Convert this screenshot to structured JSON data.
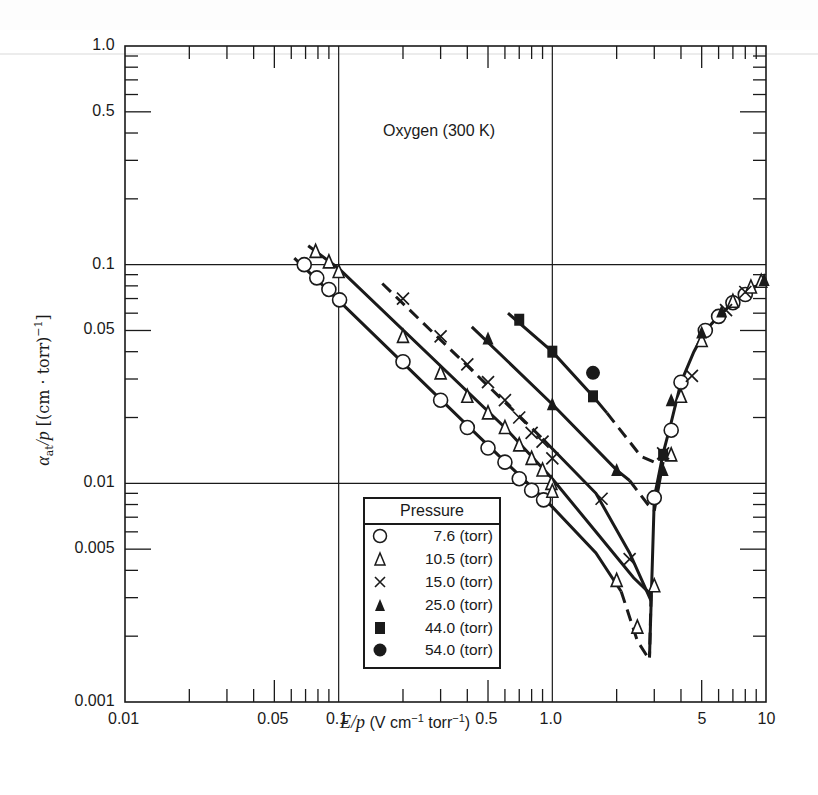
{
  "chart_data": {
    "type": "scatter",
    "title": "Oxygen (300 K)",
    "xlabel": "E/p (V cm^-1 torr^-1)",
    "ylabel": "α_at/p [(cm · torr)^-1]",
    "xscale": "log",
    "yscale": "log",
    "xlim": [
      0.01,
      10
    ],
    "ylim": [
      0.001,
      1.0
    ],
    "x_ticks": [
      "0.01",
      "0.05",
      "0.1",
      "0.5",
      "1.0",
      "5",
      "10"
    ],
    "y_ticks": [
      "0.001",
      "0.005",
      "0.01",
      "0.05",
      "0.1",
      "0.5",
      "1.0"
    ],
    "grid": "major decades only (x=0.1, 1.0; y=0.01, 0.1)",
    "legend_title": "Pressure",
    "legend_position": "lower center-left, inside plot",
    "series": [
      {
        "name": "7.6 (torr)",
        "marker": "open-circle",
        "points": [
          [
            0.069,
            0.1
          ],
          [
            0.079,
            0.087
          ],
          [
            0.09,
            0.077
          ],
          [
            0.101,
            0.069
          ],
          [
            0.2,
            0.036
          ],
          [
            0.3,
            0.024
          ],
          [
            0.4,
            0.018
          ],
          [
            0.5,
            0.0145
          ],
          [
            0.6,
            0.0125
          ],
          [
            0.7,
            0.0105
          ],
          [
            0.8,
            0.0093
          ],
          [
            0.91,
            0.0084
          ],
          [
            3.0,
            0.0086
          ],
          [
            3.6,
            0.0175
          ],
          [
            4.0,
            0.029
          ],
          [
            5.2,
            0.05
          ],
          [
            6.0,
            0.058
          ],
          [
            7.0,
            0.067
          ],
          [
            8.0,
            0.073
          ]
        ],
        "falling_curve_min": [
          2.8,
          0.0016
        ]
      },
      {
        "name": "10.5 (torr)",
        "marker": "open-triangle",
        "points": [
          [
            0.078,
            0.115
          ],
          [
            0.09,
            0.103
          ],
          [
            0.1,
            0.093
          ],
          [
            0.2,
            0.047
          ],
          [
            0.3,
            0.032
          ],
          [
            0.4,
            0.025
          ],
          [
            0.5,
            0.021
          ],
          [
            0.6,
            0.018
          ],
          [
            0.7,
            0.015
          ],
          [
            0.8,
            0.013
          ],
          [
            0.9,
            0.0115
          ],
          [
            0.99,
            0.01
          ],
          [
            1.0,
            0.0092
          ],
          [
            2.0,
            0.0036
          ],
          [
            2.5,
            0.0022
          ],
          [
            3.0,
            0.0034
          ],
          [
            3.6,
            0.0135
          ],
          [
            4.0,
            0.025
          ],
          [
            5.0,
            0.045
          ],
          [
            7.0,
            0.068
          ],
          [
            8.5,
            0.079
          ],
          [
            9.5,
            0.084
          ]
        ],
        "falling_curve_min": [
          2.8,
          0.0016
        ]
      },
      {
        "name": "15.0 (torr)",
        "marker": "x",
        "points": [
          [
            0.2,
            0.07
          ],
          [
            0.3,
            0.047
          ],
          [
            0.4,
            0.035
          ],
          [
            0.5,
            0.029
          ],
          [
            0.6,
            0.024
          ],
          [
            0.7,
            0.02
          ],
          [
            0.8,
            0.017
          ],
          [
            0.9,
            0.0155
          ],
          [
            1.0,
            0.013
          ],
          [
            1.7,
            0.0085
          ],
          [
            2.3,
            0.0045
          ],
          [
            3.3,
            0.0137
          ],
          [
            4.5,
            0.031
          ],
          [
            6.5,
            0.062
          ],
          [
            8.0,
            0.075
          ]
        ],
        "falling_curve_min": [
          2.9,
          0.0029
        ]
      },
      {
        "name": "25.0 (torr)",
        "marker": "filled-triangle",
        "points": [
          [
            0.5,
            0.046
          ],
          [
            1.0,
            0.023
          ],
          [
            2.0,
            0.0115
          ],
          [
            3.3,
            0.0115
          ],
          [
            3.6,
            0.024
          ],
          [
            5.0,
            0.049
          ],
          [
            6.2,
            0.061
          ],
          [
            9.8,
            0.085
          ]
        ],
        "falling_curve_min": [
          3.0,
          0.0075
        ]
      },
      {
        "name": "44.0 (torr)",
        "marker": "filled-square",
        "points": [
          [
            0.7,
            0.056
          ],
          [
            1.0,
            0.04
          ],
          [
            1.55,
            0.025
          ],
          [
            3.3,
            0.0135
          ]
        ],
        "falling_curve_min": [
          3.0,
          0.0125
        ]
      },
      {
        "name": "54.0 (torr)",
        "marker": "filled-circle",
        "points": [
          [
            1.55,
            0.032
          ]
        ]
      }
    ]
  },
  "labels": {
    "title": "Oxygen (300 K)",
    "xlabel_var": "E/p",
    "xlabel_unit": "(V cm",
    "xlabel_sup1": "−1",
    "xlabel_mid": " torr",
    "xlabel_sup2": "−1",
    "xlabel_end": ")",
    "ylabel_var": "α",
    "ylabel_sub": "at",
    "ylabel_p": "/p",
    "ylabel_unit": " [(cm · torr)",
    "ylabel_sup": "−1",
    "ylabel_end": "]"
  },
  "legend": {
    "title": "Pressure",
    "items": [
      {
        "symbol": "open-circle",
        "label": "7.6 (torr)"
      },
      {
        "symbol": "open-triangle",
        "label": "10.5 (torr)"
      },
      {
        "symbol": "x",
        "label": "15.0 (torr)"
      },
      {
        "symbol": "filled-triangle",
        "label": "25.0 (torr)"
      },
      {
        "symbol": "filled-square",
        "label": "44.0 (torr)"
      },
      {
        "symbol": "filled-circle",
        "label": "54.0 (torr)"
      }
    ]
  },
  "colors": {
    "ink": "#1a1a1a",
    "background": "#ffffff"
  }
}
